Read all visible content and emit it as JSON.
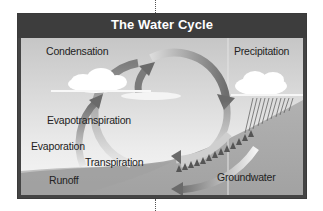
{
  "diagram": {
    "title": "The Water Cycle",
    "labels": {
      "condensation": "Condensation",
      "precipitation": "Precipitation",
      "evapotranspiration": "Evapotranspiration",
      "evaporation": "Evaporation",
      "transpiration": "Transpiration",
      "runoff": "Runoff",
      "groundwater": "Groundwater"
    },
    "colors": {
      "header": "#3d3d3d",
      "sky_top": "#c9c9c9",
      "sky_bottom": "#f2f2f2",
      "ground": "#a9a9a9",
      "arrow": "#7a7a7a",
      "cloud": "#ffffff",
      "trees": "#555555"
    }
  }
}
